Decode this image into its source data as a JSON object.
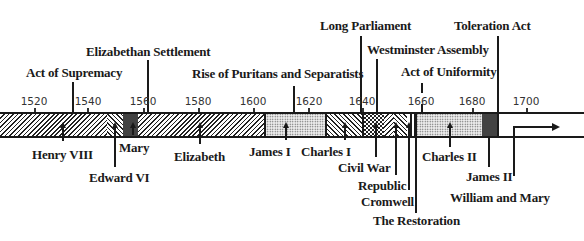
{
  "diagram": {
    "type": "timeline",
    "axis": {
      "ticks": [
        {
          "year": 1520,
          "x": 34
        },
        {
          "year": 1540,
          "x": 86
        },
        {
          "year": 1560,
          "x": 143
        },
        {
          "year": 1580,
          "x": 198
        },
        {
          "year": 1600,
          "x": 253
        },
        {
          "year": 1620,
          "x": 308
        },
        {
          "year": 1640,
          "x": 362
        },
        {
          "year": 1660,
          "x": 421
        },
        {
          "year": 1680,
          "x": 472
        },
        {
          "year": 1700,
          "x": 526
        }
      ]
    },
    "events_above": [
      {
        "label": "Act of Supremacy",
        "year": 1534
      },
      {
        "label": "Elizabethan Settlement",
        "year": 1559
      },
      {
        "label": "Rise of Puritans and Separatists",
        "year": 1614
      },
      {
        "label": "Long Parliament",
        "year": 1640
      },
      {
        "label": "Westminster Assembly",
        "year": 1643
      },
      {
        "label": "Act of Uniformity",
        "year": 1662
      },
      {
        "label": "Toleration Act",
        "year": 1689
      }
    ],
    "reigns_below": [
      {
        "label": "Henry VIII",
        "start": 1509,
        "end": 1547
      },
      {
        "label": "Edward VI",
        "start": 1547,
        "end": 1553
      },
      {
        "label": "Mary",
        "start": 1553,
        "end": 1558
      },
      {
        "label": "Elizabeth",
        "start": 1558,
        "end": 1603
      },
      {
        "label": "James I",
        "start": 1603,
        "end": 1625
      },
      {
        "label": "Charles I",
        "start": 1625,
        "end": 1642
      },
      {
        "label": "Civil War",
        "start": 1642,
        "end": 1649
      },
      {
        "label": "Republic",
        "start": 1649,
        "end": 1653
      },
      {
        "label": "Cromwell",
        "start": 1653,
        "end": 1659
      },
      {
        "label": "The Restoration",
        "start": 1660,
        "end": 1660
      },
      {
        "label": "Charles II",
        "start": 1660,
        "end": 1685
      },
      {
        "label": "James II",
        "start": 1685,
        "end": 1688
      },
      {
        "label": "William and Mary",
        "start": 1689,
        "end": 1702
      }
    ]
  }
}
